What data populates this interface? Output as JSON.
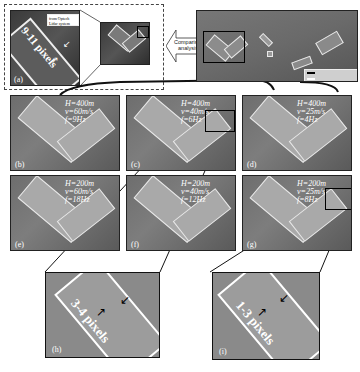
{
  "overview": {
    "inset_a": {
      "label": "(a)",
      "callout": "from Optech Lidar system",
      "measure": "9-11 pixels"
    },
    "comparison_arrow": {
      "label": "Comparison analysis"
    },
    "legend": {
      "items": [
        "(illegible legend line 1)",
        "(illegible legend line 2)"
      ]
    }
  },
  "panels": [
    {
      "label": "(b)",
      "H": "H=400m",
      "v": "v=60m/s",
      "f": "f=9Hz"
    },
    {
      "label": "(c)",
      "H": "H=400m",
      "v": "v=40m/s",
      "f": "f=6Hz"
    },
    {
      "label": "(d)",
      "H": "H=400m",
      "v": "v=25m/s",
      "f": "f=4Hz"
    },
    {
      "label": "(e)",
      "H": "H=200m",
      "v": "v=60m/s",
      "f": "f=18Hz"
    },
    {
      "label": "(f)",
      "H": "H=200m",
      "v": "v=40m/s",
      "f": "f=12Hz"
    },
    {
      "label": "(g)",
      "H": "H=200m",
      "v": "v=25m/s",
      "f": "f=8Hz"
    }
  ],
  "zooms": [
    {
      "label": "(h)",
      "measure": "3-4 pixels"
    },
    {
      "label": "(i)",
      "measure": "1-3 pixels"
    }
  ]
}
